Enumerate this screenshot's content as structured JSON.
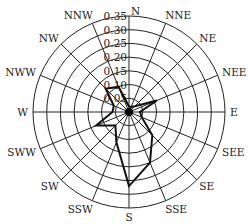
{
  "chart_data": {
    "type": "radar",
    "title": "",
    "directions": [
      "N",
      "NNE",
      "NE",
      "NEE",
      "E",
      "SEE",
      "SE",
      "SSE",
      "S",
      "SSW",
      "SW",
      "SWW",
      "W",
      "NWW",
      "NW",
      "NNW"
    ],
    "values": [
      0.02,
      0.02,
      0.03,
      0.11,
      0.04,
      0.05,
      0.12,
      0.2,
      0.27,
      0.12,
      0.07,
      0.13,
      0.06,
      0.06,
      0.12,
      0.1
    ],
    "radial_ticks": [
      "0.05",
      "0.10",
      "0.15",
      "0.20",
      "0.25",
      "0.30",
      "0.35"
    ],
    "rmax": 0.35,
    "grid": true,
    "line_color": "#111111",
    "grid_color": "#222222"
  }
}
